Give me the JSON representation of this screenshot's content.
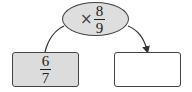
{
  "operator": {
    "symbol": "×",
    "fraction": {
      "numerator": "8",
      "denominator": "9"
    }
  },
  "input_box": {
    "fraction": {
      "numerator": "6",
      "denominator": "7"
    }
  },
  "output_box": {
    "value": ""
  },
  "colors": {
    "shaded_fill": "#dcdcdc",
    "stroke": "#444444"
  }
}
